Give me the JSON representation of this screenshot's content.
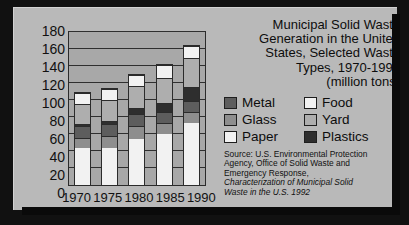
{
  "title": {
    "lines": [
      "Municipal Solid Waste",
      "Generation in the United",
      "States, Selected Waste",
      "Types, 1970-1990",
      "(million tons)"
    ]
  },
  "legend": {
    "items": [
      {
        "label": "Metal",
        "color": "#5d5d5d"
      },
      {
        "label": "Food",
        "color": "#f2f2f2"
      },
      {
        "label": "Glass",
        "color": "#8e8e8e"
      },
      {
        "label": "Yard",
        "color": "#aeaeae"
      },
      {
        "label": "Paper",
        "color": "#f2f2f2"
      },
      {
        "label": "Plastics",
        "color": "#2e2e2e"
      }
    ]
  },
  "source": {
    "line1": "Source: U.S. Environmental Protection",
    "line2": "Agency, Office of Solid Waste and",
    "line3": "Emergency Response,",
    "line4": "Characterization of Municipal Solid",
    "line5": "Waste in the U.S. 1992"
  },
  "axis": {
    "yticks": [
      "180",
      "160",
      "140",
      "120",
      "100",
      "80",
      "60",
      "40",
      "20",
      "0"
    ],
    "xticks": [
      "1970",
      "1975",
      "1980",
      "1985",
      "1990"
    ]
  },
  "chart_data": {
    "type": "bar",
    "stacked": true,
    "title": "Municipal Solid Waste Generation in the United States, Selected Waste Types, 1970-1990 (million tons)",
    "xlabel": "",
    "ylabel": "million tons",
    "ylim": [
      0,
      180
    ],
    "yticks": [
      0,
      20,
      40,
      60,
      80,
      100,
      120,
      140,
      160,
      180
    ],
    "grid": true,
    "legend_position": "right",
    "categories": [
      "1970",
      "1975",
      "1980",
      "1985",
      "1990"
    ],
    "stack_order_bottom_to_top": [
      "Paper",
      "Glass",
      "Metal",
      "Plastics",
      "Yard",
      "Food"
    ],
    "series": [
      {
        "name": "Paper",
        "color": "#f2f2f2",
        "values": [
          44,
          44,
          55,
          61,
          73
        ]
      },
      {
        "name": "Glass",
        "color": "#8e8e8e",
        "values": [
          12,
          14,
          15,
          13,
          13
        ]
      },
      {
        "name": "Metal",
        "color": "#5d5d5d",
        "values": [
          14,
          14,
          14,
          13,
          14
        ]
      },
      {
        "name": "Plastics",
        "color": "#2e2e2e",
        "values": [
          3,
          4,
          7,
          10,
          16
        ]
      },
      {
        "name": "Yard",
        "color": "#aeaeae",
        "values": [
          23,
          25,
          27,
          30,
          35
        ]
      },
      {
        "name": "Food",
        "color": "#f2f2f2",
        "values": [
          13,
          13,
          13,
          15,
          14
        ]
      }
    ],
    "totals": [
      109,
      114,
      131,
      142,
      165
    ]
  }
}
